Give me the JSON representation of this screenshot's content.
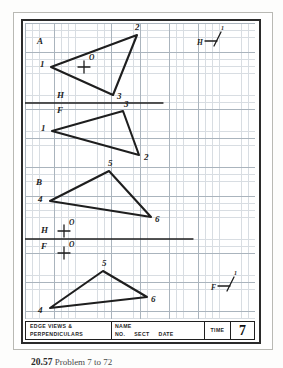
{
  "sheet": {
    "label_a": "A",
    "label_b": "B",
    "fold_marks": [
      {
        "name": "h1-fold-mark",
        "top": "H",
        "bottom": "1"
      },
      {
        "name": "f1-fold-mark",
        "top": "F",
        "bottom": "1"
      }
    ],
    "reference_lines": [
      {
        "name": "upper-fold-line",
        "above": "H",
        "below": "F"
      },
      {
        "name": "lower-fold-line",
        "above": "H",
        "below": "F"
      }
    ],
    "point_markers": [
      {
        "name": "point-o-top-view",
        "label": "O"
      },
      {
        "name": "point-o-above-lower-fold",
        "label": "O"
      },
      {
        "name": "point-o-below-lower-fold",
        "label": "O"
      }
    ],
    "triangles": [
      {
        "name": "triangle-a-top-view",
        "vertices": [
          {
            "label": "1",
            "x": 26,
            "y": 44
          },
          {
            "label": "2",
            "x": 112,
            "y": 12
          },
          {
            "label": "3",
            "x": 88,
            "y": 72
          }
        ]
      },
      {
        "name": "triangle-a-front-view",
        "vertices": [
          {
            "label": "1",
            "x": 27,
            "y": 108
          },
          {
            "label": "3",
            "x": 98,
            "y": 88
          },
          {
            "label": "2",
            "x": 114,
            "y": 132
          }
        ]
      },
      {
        "name": "triangle-b-top-view",
        "vertices": [
          {
            "label": "4",
            "x": 25,
            "y": 178
          },
          {
            "label": "5",
            "x": 84,
            "y": 148
          },
          {
            "label": "6",
            "x": 126,
            "y": 194
          }
        ]
      },
      {
        "name": "triangle-b-front-view",
        "vertices": [
          {
            "label": "4",
            "x": 25,
            "y": 285
          },
          {
            "label": "5",
            "x": 78,
            "y": 248
          },
          {
            "label": "6",
            "x": 122,
            "y": 274
          }
        ]
      }
    ]
  },
  "title_block": {
    "problem_line1": "EDGE VIEWS &",
    "problem_line2": "PERPENDICULARS",
    "name_label": "NAME",
    "no_label": "NO.",
    "sect_label": "SECT",
    "date_label": "DATE",
    "time_label": "TIME",
    "sheet_number": "7"
  },
  "caption": {
    "figure_number": "20.57",
    "text": "Problem 7 to 72"
  },
  "colors": {
    "ink": "#1e1e1e",
    "grid_fine": "#d8dde2",
    "grid_coarse": "#aab4bd",
    "paper": "#ffffff"
  }
}
